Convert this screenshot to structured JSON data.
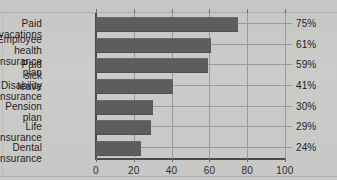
{
  "chart_data": {
    "type": "bar",
    "orientation": "horizontal",
    "title": "",
    "xlabel": "",
    "ylabel": "",
    "xlim": [
      0,
      100
    ],
    "xticks": [
      "0",
      "20",
      "40",
      "60",
      "80",
      "100"
    ],
    "grid": true,
    "legend": false,
    "categories": [
      "Paid vacations",
      "Employee health\ninsurance plan",
      "Paid sick leave",
      "Disability insurance",
      "Pension plan",
      "Life insurance",
      "Dental insurance"
    ],
    "values": [
      75,
      61,
      59,
      41,
      30,
      29,
      24
    ],
    "value_labels": [
      "75%",
      "61%",
      "59%",
      "41%",
      "30%",
      "29%",
      "24%"
    ],
    "bar_color": "#5d5d5d",
    "background_color": "#c9c9c7",
    "axis_color": "#4a4a4a",
    "gridline_color": "#9a9a98",
    "text_color": "#1f1f1f"
  }
}
